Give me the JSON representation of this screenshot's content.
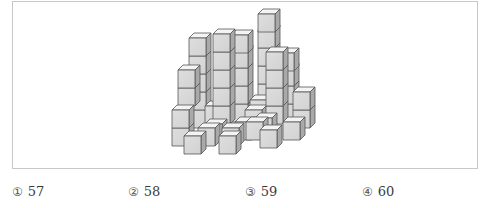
{
  "figure": {
    "colors": {
      "top": "#f4f4f4",
      "front": "#d2d2d2",
      "front_light": "#dedede",
      "side": "#a9a9a9",
      "edge": "#555555",
      "frame": "#c8c8c8"
    },
    "cube_size": {
      "w": 17,
      "h": 18,
      "dx": 5,
      "dy": 5
    },
    "cubes": [
      [
        258,
        84
      ],
      [
        258,
        66
      ],
      [
        258,
        48
      ],
      [
        258,
        30
      ],
      [
        258,
        14
      ],
      [
        277,
        104
      ],
      [
        277,
        86
      ],
      [
        277,
        68
      ],
      [
        277,
        53
      ],
      [
        231,
        104
      ],
      [
        231,
        86
      ],
      [
        231,
        68
      ],
      [
        231,
        50
      ],
      [
        231,
        35
      ],
      [
        189,
        110
      ],
      [
        189,
        92
      ],
      [
        189,
        74
      ],
      [
        189,
        56
      ],
      [
        189,
        38
      ],
      [
        205,
        106
      ],
      [
        250,
        100
      ],
      [
        245,
        110
      ],
      [
        293,
        110
      ],
      [
        293,
        92
      ],
      [
        213,
        106
      ],
      [
        213,
        88
      ],
      [
        213,
        70
      ],
      [
        213,
        52
      ],
      [
        213,
        34
      ],
      [
        266,
        106
      ],
      [
        266,
        88
      ],
      [
        266,
        70
      ],
      [
        266,
        52
      ],
      [
        255,
        118
      ],
      [
        235,
        122
      ],
      [
        205,
        124
      ],
      [
        178,
        88
      ],
      [
        178,
        70
      ],
      [
        172,
        128
      ],
      [
        172,
        110
      ],
      [
        198,
        128
      ],
      [
        222,
        128
      ],
      [
        246,
        122
      ],
      [
        283,
        122
      ],
      [
        184,
        136
      ],
      [
        219,
        136
      ],
      [
        260,
        130
      ]
    ]
  },
  "options": [
    {
      "marker": "①",
      "value": "57"
    },
    {
      "marker": "②",
      "value": "58"
    },
    {
      "marker": "③",
      "value": "59"
    },
    {
      "marker": "④",
      "value": "60"
    }
  ]
}
